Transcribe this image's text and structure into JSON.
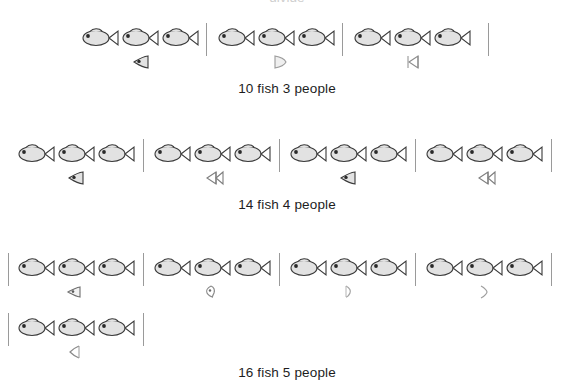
{
  "page": {
    "background_color": "#ffffff",
    "ink_color": "#1d1d1d",
    "fish_body_color": "#e0e0e0",
    "fish_outline_color": "#3a3a3a",
    "divider_color": "#9a9a9a",
    "clipped_header_text": "divide"
  },
  "icons": {
    "fish": "fish-icon",
    "fish_head": "fish-head-fraction-icon",
    "fish_mid": "fish-middle-fraction-icon",
    "fish_tail": "fish-tail-fraction-icon"
  },
  "problems": [
    {
      "id": "problem-1",
      "caption": "10 fish 3 people",
      "total_fish": 10,
      "people": 3,
      "whole_per_person": 3,
      "fraction_per_person": "1/3",
      "groups": [
        {
          "whole": 3,
          "fraction_part": "head"
        },
        {
          "whole": 3,
          "fraction_part": "mid"
        },
        {
          "whole": 3,
          "fraction_part": "tail"
        }
      ]
    },
    {
      "id": "problem-2",
      "caption": "14 fish 4 people",
      "total_fish": 14,
      "people": 4,
      "whole_per_person": 3,
      "fraction_per_person": "1/2",
      "groups": [
        {
          "whole": 3,
          "fraction_part": "head"
        },
        {
          "whole": 3,
          "fraction_part": "tail"
        },
        {
          "whole": 3,
          "fraction_part": "head"
        },
        {
          "whole": 3,
          "fraction_part": "tail"
        }
      ]
    },
    {
      "id": "problem-3",
      "caption": "16 fish 5 people",
      "total_fish": 16,
      "people": 5,
      "whole_per_person": 3,
      "fraction_per_person": "1/5",
      "groups": [
        {
          "whole": 3,
          "fraction_part": "head"
        },
        {
          "whole": 3,
          "fraction_part": "head-mid"
        },
        {
          "whole": 3,
          "fraction_part": "mid"
        },
        {
          "whole": 3,
          "fraction_part": "tail-thin"
        },
        {
          "whole": 3,
          "fraction_part": "head-narrow"
        }
      ]
    }
  ]
}
